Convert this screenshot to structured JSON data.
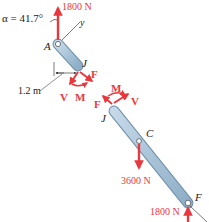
{
  "figure": {
    "type": "free-body-diagram",
    "angle_label": "α = 41.7°",
    "axis_label": "y",
    "points": {
      "A": "A",
      "J_upper": "J",
      "J_lower": "J",
      "C": "C",
      "F": "F"
    },
    "dimension": "1.2 m",
    "forces": {
      "top": "1800 N",
      "center": "3600 N",
      "bottom": "1800 N"
    },
    "internal_upper": {
      "F": "F",
      "V": "V",
      "M": "M"
    },
    "internal_lower": {
      "F": "F",
      "V": "V",
      "M": "M"
    },
    "colors": {
      "force": "#e8383d",
      "member_fill": "#aac6dc",
      "member_stroke": "#6f8fa8",
      "text": "#222222"
    }
  }
}
